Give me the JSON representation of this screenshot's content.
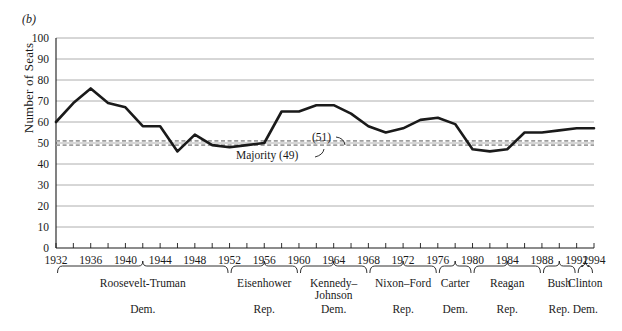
{
  "figure": {
    "panel_label": "(b)",
    "ylabel": "Number of Seats"
  },
  "chart_data": {
    "type": "line",
    "title": "",
    "xlabel": "",
    "ylabel": "Number of Seats",
    "xlim": [
      1932,
      1994
    ],
    "ylim": [
      0,
      100
    ],
    "grid": true,
    "legend": "none",
    "y_ticks": [
      0,
      10,
      20,
      30,
      40,
      50,
      60,
      70,
      80,
      90,
      100
    ],
    "x_ticks": [
      1932,
      1936,
      1940,
      1944,
      1948,
      1952,
      1956,
      1960,
      1964,
      1968,
      1972,
      1976,
      1980,
      1984,
      1988,
      1992,
      1994
    ],
    "x_minor_step": 2,
    "x": [
      1932,
      1934,
      1936,
      1938,
      1940,
      1942,
      1944,
      1946,
      1948,
      1950,
      1952,
      1954,
      1956,
      1958,
      1960,
      1962,
      1964,
      1966,
      1968,
      1970,
      1972,
      1974,
      1976,
      1978,
      1980,
      1982,
      1984,
      1986,
      1988,
      1990,
      1992,
      1994
    ],
    "series": [
      {
        "name": "Democratic Senate Seats",
        "values": [
          60,
          69,
          76,
          69,
          67,
          58,
          58,
          46,
          54,
          49,
          48,
          49,
          50,
          65,
          65,
          68,
          68,
          64,
          58,
          55,
          57,
          61,
          62,
          59,
          47,
          46,
          47,
          55,
          55,
          56,
          57,
          57
        ]
      }
    ],
    "reference_lines": [
      {
        "label": "(51)",
        "value": 51,
        "style": "dashed",
        "color": "#9d9d9d"
      },
      {
        "label": "Majority (49)",
        "value": 49,
        "style": "dashed",
        "color": "#9d9d9d"
      }
    ],
    "annotations": [
      {
        "text": "(51)",
        "target_value": 51
      },
      {
        "text": "Majority (49)",
        "target_value": 49
      }
    ],
    "eras": [
      {
        "name": "Roosevelt-Truman",
        "party": "Dem.",
        "start": 1932,
        "end": 1952
      },
      {
        "name": "Eisenhower",
        "party": "Rep.",
        "start": 1952,
        "end": 1960
      },
      {
        "name": "Kennedy–\nJohnson",
        "party": "Dem.",
        "start": 1960,
        "end": 1968
      },
      {
        "name": "Nixon–Ford",
        "party": "Rep.",
        "start": 1968,
        "end": 1976
      },
      {
        "name": "Carter",
        "party": "Dem.",
        "start": 1976,
        "end": 1980
      },
      {
        "name": "Reagan",
        "party": "Rep.",
        "start": 1980,
        "end": 1988
      },
      {
        "name": "Bush",
        "party": "Rep.",
        "start": 1988,
        "end": 1992
      },
      {
        "name": "Clinton",
        "party": "Dem.",
        "start": 1992,
        "end": 1994
      }
    ]
  }
}
